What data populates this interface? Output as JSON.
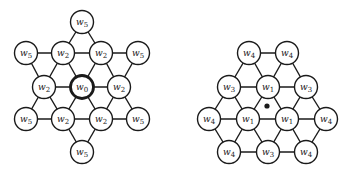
{
  "diagrams": [
    {
      "name": "hexagram-weights",
      "center_marker": "node",
      "node_radius": 11.5,
      "nodes": [
        {
          "id": "t",
          "label": "w",
          "sub": "5",
          "x": 82,
          "y": 22
        },
        {
          "id": "a1",
          "label": "w",
          "sub": "5",
          "x": 26,
          "y": 53
        },
        {
          "id": "a2",
          "label": "w",
          "sub": "2",
          "x": 63,
          "y": 53
        },
        {
          "id": "a3",
          "label": "w",
          "sub": "2",
          "x": 101,
          "y": 53
        },
        {
          "id": "a4",
          "label": "w",
          "sub": "5",
          "x": 138,
          "y": 53
        },
        {
          "id": "b1",
          "label": "w",
          "sub": "2",
          "x": 44,
          "y": 87
        },
        {
          "id": "b2",
          "label": "w",
          "sub": "0",
          "x": 82,
          "y": 87,
          "bold": true
        },
        {
          "id": "b3",
          "label": "w",
          "sub": "2",
          "x": 119,
          "y": 87
        },
        {
          "id": "c1",
          "label": "w",
          "sub": "5",
          "x": 26,
          "y": 119
        },
        {
          "id": "c2",
          "label": "w",
          "sub": "2",
          "x": 63,
          "y": 119
        },
        {
          "id": "c3",
          "label": "w",
          "sub": "2",
          "x": 101,
          "y": 119
        },
        {
          "id": "c4",
          "label": "w",
          "sub": "5",
          "x": 138,
          "y": 119
        },
        {
          "id": "bt",
          "label": "w",
          "sub": "5",
          "x": 82,
          "y": 152
        }
      ],
      "edges": [
        [
          "t",
          "a2"
        ],
        [
          "t",
          "a3"
        ],
        [
          "a1",
          "a2"
        ],
        [
          "a2",
          "a3"
        ],
        [
          "a3",
          "a4"
        ],
        [
          "a1",
          "b1"
        ],
        [
          "a2",
          "b1"
        ],
        [
          "a2",
          "b2"
        ],
        [
          "a3",
          "b2"
        ],
        [
          "a3",
          "b3"
        ],
        [
          "a4",
          "b3"
        ],
        [
          "b1",
          "b2"
        ],
        [
          "b2",
          "b3"
        ],
        [
          "b1",
          "c1"
        ],
        [
          "b1",
          "c2"
        ],
        [
          "b2",
          "c2"
        ],
        [
          "b2",
          "c3"
        ],
        [
          "b3",
          "c3"
        ],
        [
          "b3",
          "c4"
        ],
        [
          "c1",
          "c2"
        ],
        [
          "c2",
          "c3"
        ],
        [
          "c3",
          "c4"
        ],
        [
          "c2",
          "bt"
        ],
        [
          "c3",
          "bt"
        ]
      ]
    },
    {
      "name": "hexagon-weights",
      "center_marker": "dot",
      "center_dot": {
        "x": 267,
        "y": 106,
        "r": 2.6
      },
      "node_radius": 11.5,
      "nodes": [
        {
          "id": "r1",
          "label": "w",
          "sub": "4",
          "x": 249,
          "y": 53
        },
        {
          "id": "r2",
          "label": "w",
          "sub": "4",
          "x": 287,
          "y": 53
        },
        {
          "id": "s1",
          "label": "w",
          "sub": "3",
          "x": 229,
          "y": 87
        },
        {
          "id": "s2",
          "label": "w",
          "sub": "1",
          "x": 268,
          "y": 87
        },
        {
          "id": "s3",
          "label": "w",
          "sub": "3",
          "x": 306,
          "y": 87
        },
        {
          "id": "u1",
          "label": "w",
          "sub": "4",
          "x": 209,
          "y": 119
        },
        {
          "id": "u2",
          "label": "w",
          "sub": "1",
          "x": 248,
          "y": 119
        },
        {
          "id": "u3",
          "label": "w",
          "sub": "1",
          "x": 287,
          "y": 119
        },
        {
          "id": "u4",
          "label": "w",
          "sub": "4",
          "x": 326,
          "y": 119
        },
        {
          "id": "v1",
          "label": "w",
          "sub": "4",
          "x": 229,
          "y": 152
        },
        {
          "id": "v2",
          "label": "w",
          "sub": "3",
          "x": 268,
          "y": 152
        },
        {
          "id": "v3",
          "label": "w",
          "sub": "4",
          "x": 306,
          "y": 152
        }
      ],
      "edges": [
        [
          "r1",
          "r2"
        ],
        [
          "r1",
          "s1"
        ],
        [
          "r1",
          "s2"
        ],
        [
          "r2",
          "s2"
        ],
        [
          "r2",
          "s3"
        ],
        [
          "s1",
          "s2"
        ],
        [
          "s2",
          "s3"
        ],
        [
          "s1",
          "u1"
        ],
        [
          "s1",
          "u2"
        ],
        [
          "s2",
          "u2"
        ],
        [
          "s2",
          "u3"
        ],
        [
          "s3",
          "u3"
        ],
        [
          "s3",
          "u4"
        ],
        [
          "u1",
          "u2"
        ],
        [
          "u2",
          "u3"
        ],
        [
          "u3",
          "u4"
        ],
        [
          "u1",
          "v1"
        ],
        [
          "u2",
          "v1"
        ],
        [
          "u2",
          "v2"
        ],
        [
          "u3",
          "v2"
        ],
        [
          "u3",
          "v3"
        ],
        [
          "u4",
          "v3"
        ],
        [
          "v1",
          "v2"
        ],
        [
          "v2",
          "v3"
        ]
      ]
    }
  ]
}
